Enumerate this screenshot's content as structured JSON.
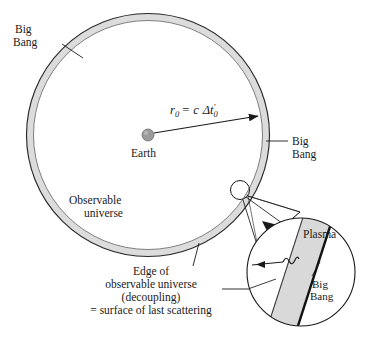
{
  "figure": {
    "colors": {
      "stroke": "#1a1a1a",
      "shell_fill": "#dcdcdc",
      "plasma_fill": "#d9d9d9",
      "earth_fill": "#9a9a9a",
      "background": "#ffffff",
      "thin_line": "#555555"
    }
  },
  "main_circle": {
    "center_label": "Earth",
    "big_bang_label_top": {
      "line1": "Big",
      "line2": "Bang"
    },
    "big_bang_label_right": {
      "line1": "Big",
      "line2": "Bang"
    },
    "observable_universe_label": {
      "line1": "Observable",
      "line2": "universe"
    },
    "radius_formula": {
      "symbol": "r",
      "symbol_sub": "0",
      "equals": "=",
      "speed": "c",
      "delta": "Δt",
      "prime": "′",
      "delta_sub": "0",
      "full_text": "r₀ = c Δt′₀"
    }
  },
  "caption": {
    "line1": "Edge of",
    "line2": "observable universe",
    "line3": "(decoupling)",
    "line4": "= surface of last scattering"
  },
  "inset": {
    "plasma_label": "Plasma",
    "big_bang_label": {
      "line1": "Big",
      "line2": "Bang"
    }
  }
}
